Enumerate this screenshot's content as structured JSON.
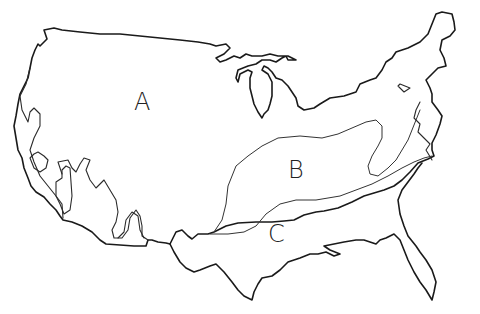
{
  "diagram": {
    "type": "outline map",
    "line_color": "#1a1a1a",
    "background": "#ffffff"
  },
  "regions": [
    {
      "id": "A",
      "label": "A"
    },
    {
      "id": "B",
      "label": "B"
    },
    {
      "id": "C",
      "label": "C"
    }
  ]
}
